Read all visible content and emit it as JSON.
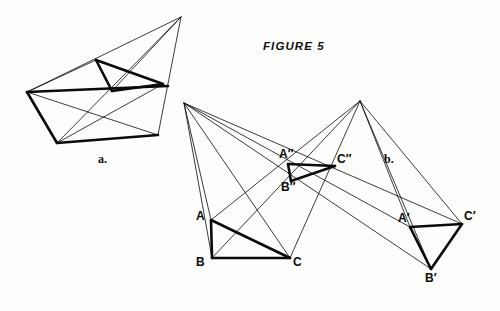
{
  "figure": {
    "title": "FIGURE 5",
    "title_pos": {
      "x": 263,
      "y": 40
    },
    "background": "#fdfdfc",
    "ink": "#0a0a0a",
    "thin_width": 0.8,
    "thick_width": 2.6
  },
  "panels": [
    {
      "name": "panel-a",
      "label": "a.",
      "x": 98,
      "y": 152
    },
    {
      "name": "panel-b",
      "label": "b.",
      "x": 384,
      "y": 152
    }
  ],
  "panel_a": {
    "description": "Two nested triangles in perspective converging to an apex point",
    "points": {
      "apex": {
        "x": 181,
        "y": 17
      },
      "outer_left": {
        "x": 27,
        "y": 92
      },
      "outer_bottom_left": {
        "x": 57,
        "y": 143
      },
      "outer_bottom_right": {
        "x": 158,
        "y": 135
      },
      "outer_right": {
        "x": 168,
        "y": 86
      },
      "inner_top": {
        "x": 96,
        "y": 60
      },
      "inner_bottom": {
        "x": 112,
        "y": 91
      },
      "inner_right": {
        "x": 163,
        "y": 84
      }
    },
    "thin_lines": [
      {
        "from": "apex",
        "to": "outer_left"
      },
      {
        "from": "apex",
        "to": "outer_bottom_left"
      },
      {
        "from": "apex",
        "to": "outer_bottom_right"
      },
      {
        "from": "apex",
        "to": "inner_bottom"
      },
      {
        "from": "outer_left",
        "to": "outer_bottom_right"
      },
      {
        "from": "outer_bottom_left",
        "to": "inner_right"
      },
      {
        "from": "outer_left",
        "to": "inner_top"
      }
    ],
    "thick_lines": [
      {
        "from": "outer_left",
        "to": "outer_bottom_left"
      },
      {
        "from": "outer_bottom_left",
        "to": "outer_bottom_right"
      },
      {
        "from": "outer_left",
        "to": "outer_right"
      },
      {
        "from": "inner_top",
        "to": "inner_bottom"
      },
      {
        "from": "inner_bottom",
        "to": "inner_right"
      },
      {
        "from": "inner_top",
        "to": "inner_right"
      }
    ]
  },
  "panel_b": {
    "description": "Two perspective centers projecting triangle ABC and A'B'C' onto A\"B\"C\"",
    "points": {
      "center_left": {
        "x": 184,
        "y": 103
      },
      "center_right": {
        "x": 360,
        "y": 101
      },
      "A": {
        "x": 211,
        "y": 220
      },
      "B": {
        "x": 212,
        "y": 258
      },
      "C": {
        "x": 290,
        "y": 258
      },
      "Ap": {
        "x": 410,
        "y": 227
      },
      "Bp": {
        "x": 431,
        "y": 269
      },
      "Cp": {
        "x": 462,
        "y": 224
      },
      "App": {
        "x": 288,
        "y": 164
      },
      "Bpp": {
        "x": 291,
        "y": 181
      },
      "Cpp": {
        "x": 335,
        "y": 166
      }
    },
    "thin_lines": [
      {
        "from": "center_left",
        "to": "A"
      },
      {
        "from": "center_left",
        "to": "B"
      },
      {
        "from": "center_left",
        "to": "C"
      },
      {
        "from": "center_left",
        "to": "Ap"
      },
      {
        "from": "center_left",
        "to": "Bp"
      },
      {
        "from": "center_left",
        "to": "Cp"
      },
      {
        "from": "center_right",
        "to": "A"
      },
      {
        "from": "center_right",
        "to": "B"
      },
      {
        "from": "center_right",
        "to": "C"
      },
      {
        "from": "center_right",
        "to": "Ap"
      },
      {
        "from": "center_right",
        "to": "Bp"
      },
      {
        "from": "center_right",
        "to": "Cp"
      },
      {
        "from": "A",
        "to": "C"
      }
    ],
    "thick_lines": [
      {
        "from": "A",
        "to": "B"
      },
      {
        "from": "B",
        "to": "C"
      },
      {
        "from": "A",
        "to": "C"
      },
      {
        "from": "Ap",
        "to": "Bp"
      },
      {
        "from": "Bp",
        "to": "Cp"
      },
      {
        "from": "Ap",
        "to": "Cp"
      },
      {
        "from": "App",
        "to": "Bpp"
      },
      {
        "from": "Bpp",
        "to": "Cpp"
      },
      {
        "from": "App",
        "to": "Cpp"
      }
    ],
    "labels": [
      {
        "name": "label-A",
        "text": "A",
        "x": 196,
        "y": 210
      },
      {
        "name": "label-B",
        "text": "B",
        "x": 196,
        "y": 256
      },
      {
        "name": "label-C",
        "text": "C",
        "x": 293,
        "y": 256
      },
      {
        "name": "label-A-prime",
        "text": "A′",
        "x": 398,
        "y": 212
      },
      {
        "name": "label-B-prime",
        "text": "B′",
        "x": 425,
        "y": 272
      },
      {
        "name": "label-C-prime",
        "text": "C′",
        "x": 464,
        "y": 210
      },
      {
        "name": "label-A-double-prime",
        "text": "A″",
        "x": 279,
        "y": 148
      },
      {
        "name": "label-B-double-prime",
        "text": "B″",
        "x": 281,
        "y": 181
      },
      {
        "name": "label-C-double-prime",
        "text": "C″",
        "x": 337,
        "y": 153
      }
    ]
  }
}
